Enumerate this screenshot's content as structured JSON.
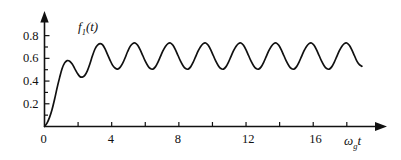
{
  "chart_data": {
    "type": "line",
    "title": "",
    "xlabel": "ω_g t",
    "ylabel": "f₁(t)",
    "xlim": [
      0,
      19.5
    ],
    "ylim": [
      0,
      0.92
    ],
    "grid": false,
    "legend_position": "none",
    "line_color": "#111111",
    "series": [
      {
        "name": "f1(t)",
        "description": "Damped oscillatory step response rising from 0, first peak 0.58, settling into sustained oscillation between 0.50 and 0.73",
        "steady_state_mean": 0.615,
        "steady_state_min": 0.5,
        "steady_state_max": 0.73,
        "period": 1.6,
        "x": [
          0,
          0.15,
          0.3,
          0.45,
          0.6,
          0.75,
          0.9,
          1.05,
          1.2,
          1.35,
          1.5,
          1.65,
          1.8,
          1.95,
          2.1,
          2.25,
          2.4,
          2.55,
          2.7,
          2.85,
          3.0,
          3.15,
          3.3,
          3.45,
          3.6,
          3.75,
          3.9,
          4.05,
          4.2,
          4.35,
          4.5,
          4.65,
          4.8,
          4.95,
          5.1,
          5.25,
          5.4,
          5.55,
          5.7,
          5.85,
          6.0,
          6.15,
          6.3,
          6.45,
          6.6,
          6.75,
          6.9,
          7.05,
          7.2,
          7.35,
          7.5,
          7.65,
          7.8,
          7.95,
          8.1,
          8.25,
          8.4,
          8.55,
          8.7,
          8.85,
          9.0,
          9.15,
          9.3,
          9.45,
          9.6,
          9.75,
          9.9,
          10.05,
          10.2,
          10.35,
          10.5,
          10.65,
          10.8,
          10.95,
          11.1,
          11.25,
          11.4,
          11.55,
          11.7,
          11.85,
          12.0,
          12.15,
          12.3,
          12.45,
          12.6,
          12.75,
          12.9,
          13.05,
          13.2,
          13.35,
          13.5,
          13.65,
          13.8,
          13.95,
          14.1,
          14.25,
          14.4,
          14.55,
          14.7,
          14.85,
          15.0,
          15.15,
          15.3,
          15.45,
          15.6,
          15.75,
          15.9,
          16.05,
          16.2,
          16.35,
          16.5,
          16.65,
          16.8,
          16.95,
          17.1,
          17.25,
          17.4,
          17.55,
          17.7,
          17.85,
          18.0,
          18.15,
          18.3,
          18.45,
          18.6,
          18.75,
          18.9
        ],
        "y": [
          0.0,
          0.03,
          0.08,
          0.15,
          0.24,
          0.34,
          0.43,
          0.51,
          0.56,
          0.58,
          0.575,
          0.55,
          0.51,
          0.47,
          0.44,
          0.435,
          0.45,
          0.49,
          0.55,
          0.62,
          0.68,
          0.715,
          0.73,
          0.72,
          0.685,
          0.635,
          0.585,
          0.54,
          0.515,
          0.505,
          0.52,
          0.555,
          0.605,
          0.66,
          0.705,
          0.73,
          0.735,
          0.715,
          0.675,
          0.625,
          0.575,
          0.535,
          0.51,
          0.505,
          0.525,
          0.565,
          0.615,
          0.665,
          0.705,
          0.73,
          0.735,
          0.715,
          0.675,
          0.625,
          0.575,
          0.535,
          0.51,
          0.505,
          0.525,
          0.565,
          0.615,
          0.665,
          0.705,
          0.73,
          0.735,
          0.715,
          0.675,
          0.625,
          0.575,
          0.535,
          0.51,
          0.505,
          0.525,
          0.565,
          0.615,
          0.665,
          0.705,
          0.73,
          0.735,
          0.715,
          0.675,
          0.625,
          0.575,
          0.535,
          0.51,
          0.505,
          0.525,
          0.565,
          0.615,
          0.665,
          0.705,
          0.73,
          0.735,
          0.715,
          0.675,
          0.625,
          0.575,
          0.535,
          0.51,
          0.505,
          0.525,
          0.565,
          0.615,
          0.665,
          0.705,
          0.73,
          0.735,
          0.715,
          0.675,
          0.625,
          0.575,
          0.535,
          0.51,
          0.505,
          0.525,
          0.565,
          0.615,
          0.665,
          0.705,
          0.73,
          0.735,
          0.715,
          0.675,
          0.625,
          0.575,
          0.545,
          0.53
        ]
      }
    ],
    "xticks": [
      0,
      2,
      4,
      6,
      8,
      10,
      12,
      14,
      16,
      18
    ],
    "xtick_labels": [
      "0",
      "",
      "4",
      "",
      "8",
      "",
      "12",
      "",
      "16",
      ""
    ],
    "yticks": [
      0.1,
      0.2,
      0.3,
      0.4,
      0.5,
      0.6,
      0.7,
      0.8
    ],
    "ytick_labels": [
      "",
      "0.2",
      "",
      "0.4",
      "",
      "0.6",
      "",
      "0.8"
    ]
  },
  "axes": {
    "y_axis_name": "f",
    "y_axis_sub": "1",
    "y_axis_arg": "(t)",
    "x_axis_name": "ω",
    "x_axis_sub": "g",
    "x_axis_var": "t"
  }
}
